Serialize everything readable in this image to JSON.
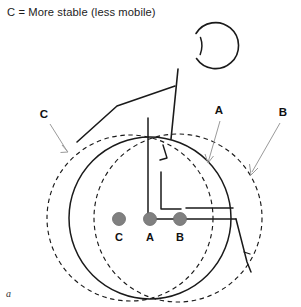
{
  "figure": {
    "caption": "C = More stable (less mobile)",
    "panel_label": "a",
    "title_region_name": "figure-caption"
  },
  "callouts": {
    "c": {
      "label": "C",
      "x": 44,
      "y": 118,
      "arrow_from": [
        50,
        124
      ],
      "arrow_to": [
        68,
        152
      ]
    },
    "a": {
      "label": "A",
      "x": 219,
      "y": 114,
      "arrow_from": [
        221,
        120
      ],
      "arrow_to": [
        208,
        163
      ]
    },
    "b": {
      "label": "B",
      "x": 283,
      "y": 116,
      "arrow_from": [
        281,
        122
      ],
      "arrow_to": [
        251,
        175
      ]
    }
  },
  "axle_markers": [
    {
      "label": "C",
      "cx": 119,
      "cy": 219,
      "r": 6.5,
      "text_x": 119,
      "text_y": 241
    },
    {
      "label": "A",
      "cx": 150,
      "cy": 219,
      "r": 6.5,
      "text_x": 150,
      "text_y": 241
    },
    {
      "label": "B",
      "cx": 180,
      "cy": 219,
      "r": 6.5,
      "text_x": 180,
      "text_y": 241
    }
  ],
  "wheels": [
    {
      "name": "wheel-c-dashed",
      "cx": 130,
      "cy": 218,
      "r": 83,
      "style": "dashed"
    },
    {
      "name": "wheel-a-solid",
      "cx": 150,
      "cy": 218,
      "r": 81,
      "style": "solid"
    },
    {
      "name": "wheel-b-dashed",
      "cx": 178,
      "cy": 218,
      "r": 84,
      "style": "dashed"
    }
  ],
  "colors": {
    "line": "#1a1a1a",
    "dot_fill": "#808080",
    "dot_stroke": "#6b6b6b",
    "leader": "#9a9a9a",
    "background": "#ffffff"
  },
  "person": {
    "head": {
      "cx": 180,
      "cy": 46,
      "r": 23
    },
    "trunk_name": "trunk-line",
    "arm_name": "arm-line",
    "leg_name": "leg-line",
    "seat_name": "seat-line",
    "footrest_name": "footrest-line"
  }
}
